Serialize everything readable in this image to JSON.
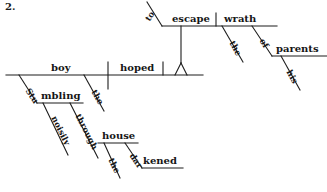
{
  "exercise": {
    "number": "2.",
    "sentence": "Stumbling noisily through the darkened house, the boy hoped to escape the wrath of his parents.",
    "type": "reed-kellogg-sentence-diagram"
  },
  "diagram": {
    "words": {
      "subject": "boy",
      "subject_article": "the",
      "verb": "hoped",
      "participle_part1": "Stu",
      "participle_part2": "mbling",
      "participle_full": "Stumbling",
      "adverb": "noisily",
      "preposition_through": "through",
      "house_article": "the",
      "house_object": "house",
      "adjective_part1": "dar",
      "adjective_part2": "kened",
      "adjective_full": "darkened",
      "infinitive_marker": "to",
      "infinitive_verb": "escape",
      "infinitive_object": "wrath",
      "wrath_article": "the",
      "preposition_of": "of",
      "of_object": "parents",
      "possessive": "his"
    }
  },
  "colors": {
    "ink": "#161616",
    "line": "#1c1c1c",
    "background": "#ffffff"
  }
}
